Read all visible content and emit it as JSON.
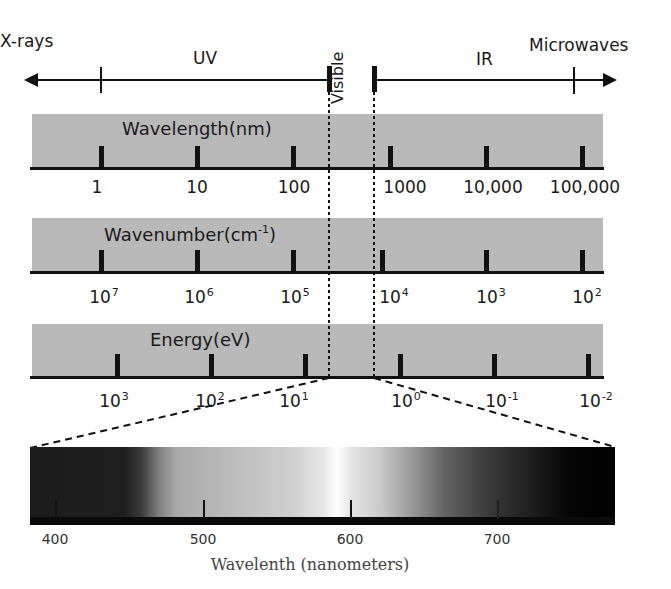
{
  "diagram": {
    "type": "electromagnetic-spectrum-scale",
    "top_axis": {
      "regions": [
        {
          "key": "xrays",
          "label": "X-rays"
        },
        {
          "key": "uv",
          "label": "UV"
        },
        {
          "key": "visible",
          "label": "Visible"
        },
        {
          "key": "ir",
          "label": "IR"
        },
        {
          "key": "microwaves",
          "label": "Microwaves"
        }
      ]
    },
    "scales": [
      {
        "title": "Wavelength(nm)",
        "ticks": [
          {
            "base": "1",
            "exp": ""
          },
          {
            "base": "10",
            "exp": ""
          },
          {
            "base": "100",
            "exp": ""
          },
          {
            "base": "1000",
            "exp": ""
          },
          {
            "base": "10,000",
            "exp": ""
          },
          {
            "base": "100,000",
            "exp": ""
          }
        ]
      },
      {
        "title": "Wavenumber(cm",
        "title_sup": "-1",
        "title_suffix": ")",
        "ticks": [
          {
            "base": "10",
            "exp": "7"
          },
          {
            "base": "10",
            "exp": "6"
          },
          {
            "base": "10",
            "exp": "5"
          },
          {
            "base": "10",
            "exp": "4"
          },
          {
            "base": "10",
            "exp": "3"
          },
          {
            "base": "10",
            "exp": "2"
          }
        ]
      },
      {
        "title": "Energy(eV)",
        "ticks": [
          {
            "base": "10",
            "exp": "3"
          },
          {
            "base": "10",
            "exp": "2"
          },
          {
            "base": "10",
            "exp": "1"
          },
          {
            "base": "10",
            "exp": "0"
          },
          {
            "base": "10",
            "exp": "-1"
          },
          {
            "base": "10",
            "exp": "-2"
          }
        ]
      }
    ],
    "visible_spectrum": {
      "ticks": [
        "400",
        "500",
        "600",
        "700"
      ],
      "axis_label": "Wavelenth (nanometers)"
    }
  }
}
